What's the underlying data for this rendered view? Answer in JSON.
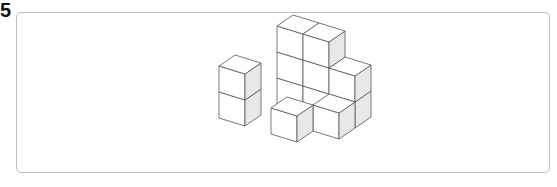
{
  "question": {
    "number": "5"
  },
  "figure": {
    "cube_count": 11,
    "colors": {
      "top": "#ffffff",
      "front": "#ffffff",
      "side": "#e8e8e8",
      "stroke": "#555555"
    },
    "voxels": [
      [
        1,
        2,
        0
      ],
      [
        2,
        2,
        0
      ],
      [
        1,
        2,
        1
      ],
      [
        2,
        2,
        1
      ],
      [
        1,
        2,
        2
      ],
      [
        2,
        2,
        2
      ],
      [
        3,
        2,
        0
      ],
      [
        3,
        2,
        1
      ],
      [
        0,
        0,
        0
      ],
      [
        0,
        0,
        1
      ],
      [
        3,
        1,
        0
      ],
      [
        2,
        0,
        0
      ]
    ]
  }
}
